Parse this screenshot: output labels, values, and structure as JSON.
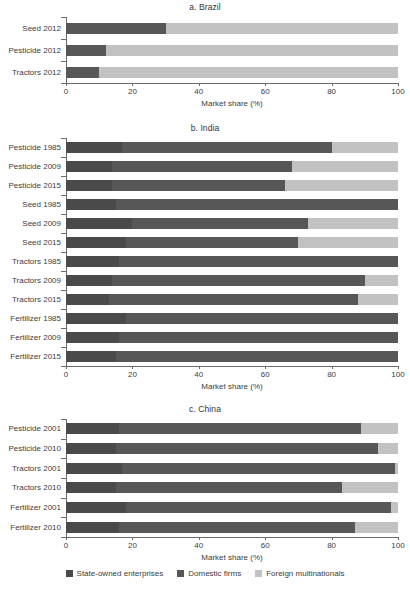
{
  "figure": {
    "axis_title": "Market share (%)",
    "tick_labels": [
      "0",
      "20",
      "40",
      "60",
      "80",
      "100"
    ],
    "legend": [
      {
        "key": "state",
        "label": "State-owned enterprises",
        "color": "#4a4a4a"
      },
      {
        "key": "domestic",
        "label": "Domestic firms",
        "color": "#575757"
      },
      {
        "key": "foreign",
        "label": "Foreign multinationals",
        "color": "#c2c2c2"
      }
    ]
  },
  "chart_data": [
    {
      "type": "bar",
      "orientation": "horizontal",
      "stacked": true,
      "title": "a. Brazil",
      "xlabel": "Market share (%)",
      "ylabel": "",
      "xlim": [
        0,
        100
      ],
      "ticks": [
        0,
        20,
        40,
        60,
        80,
        100
      ],
      "grid": false,
      "legend_position": "bottom",
      "categories": [
        "Seed 2012",
        "Pesticide 2012",
        "Tractors 2012"
      ],
      "series": [
        {
          "name": "State-owned enterprises",
          "values": [
            0,
            0,
            0
          ]
        },
        {
          "name": "Domestic firms",
          "values": [
            30,
            12,
            10
          ]
        },
        {
          "name": "Foreign multinationals",
          "values": [
            70,
            88,
            90
          ]
        }
      ]
    },
    {
      "type": "bar",
      "orientation": "horizontal",
      "stacked": true,
      "title": "b. India",
      "xlabel": "Market share (%)",
      "ylabel": "",
      "xlim": [
        0,
        100
      ],
      "ticks": [
        0,
        20,
        40,
        60,
        80,
        100
      ],
      "grid": false,
      "legend_position": "bottom",
      "categories": [
        "Pesticide 1985",
        "Pesticide 2009",
        "Pesticide 2015",
        "Seed 1985",
        "Seed 2009",
        "Seed 2015",
        "Tractors 1985",
        "Tractors 2009",
        "Tractors 2015",
        "Fertilizer 1985",
        "Fertilizer 2009",
        "Fertilizer 2015"
      ],
      "series": [
        {
          "name": "State-owned enterprises",
          "values": [
            17,
            14,
            14,
            15,
            20,
            18,
            16,
            14,
            13,
            18,
            16,
            15
          ]
        },
        {
          "name": "Domestic firms",
          "values": [
            63,
            54,
            52,
            85,
            53,
            52,
            84,
            76,
            75,
            82,
            84,
            85
          ]
        },
        {
          "name": "Foreign multinationals",
          "values": [
            20,
            32,
            34,
            0,
            27,
            30,
            0,
            10,
            12,
            0,
            0,
            0
          ]
        }
      ]
    },
    {
      "type": "bar",
      "orientation": "horizontal",
      "stacked": true,
      "title": "c. China",
      "xlabel": "Market share (%)",
      "ylabel": "",
      "xlim": [
        0,
        100
      ],
      "ticks": [
        0,
        20,
        40,
        60,
        80,
        100
      ],
      "grid": false,
      "legend_position": "bottom",
      "categories": [
        "Pesticide 2001",
        "Pesticide 2010",
        "Tractors 2001",
        "Tractors 2010",
        "Fertilizer 2001",
        "Fertilizer 2010"
      ],
      "series": [
        {
          "name": "State-owned enterprises",
          "values": [
            16,
            15,
            17,
            15,
            18,
            16
          ]
        },
        {
          "name": "Domestic firms",
          "values": [
            73,
            79,
            82,
            68,
            80,
            71
          ]
        },
        {
          "name": "Foreign multinationals",
          "values": [
            11,
            6,
            1,
            17,
            2,
            13
          ]
        }
      ]
    }
  ]
}
